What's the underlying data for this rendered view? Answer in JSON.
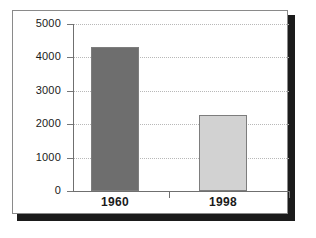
{
  "chart_data": {
    "type": "bar",
    "title": "",
    "subtitle": "",
    "xlabel": "",
    "ylabel": "",
    "categories": [
      "1960",
      "1998"
    ],
    "values": [
      4300,
      2280
    ],
    "series": [
      {
        "name": "",
        "values": [
          4300,
          2280
        ]
      }
    ],
    "ylim": [
      0,
      5000
    ],
    "yticks": [
      0,
      1000,
      2000,
      3000,
      4000,
      5000
    ],
    "ytick_labels": [
      "0",
      "1000",
      "2000",
      "3000",
      "4000",
      "5000"
    ],
    "grid": true,
    "grid_style": "dotted",
    "grid_axis": "y",
    "legend": false,
    "legend_position": "none",
    "bar_colors": [
      "#6e6e6e",
      "#d2d2d2"
    ],
    "bar_edge_color": "#7d7d7d",
    "annotations": []
  },
  "figure": {
    "frame_color": "#8a8a8a",
    "shadow_color": "#1b1b1b",
    "background": "#ffffff",
    "axis_color": "#6f6f6f",
    "gridline_color": "#b8b8b8",
    "text_color": "#1a1a1a"
  }
}
